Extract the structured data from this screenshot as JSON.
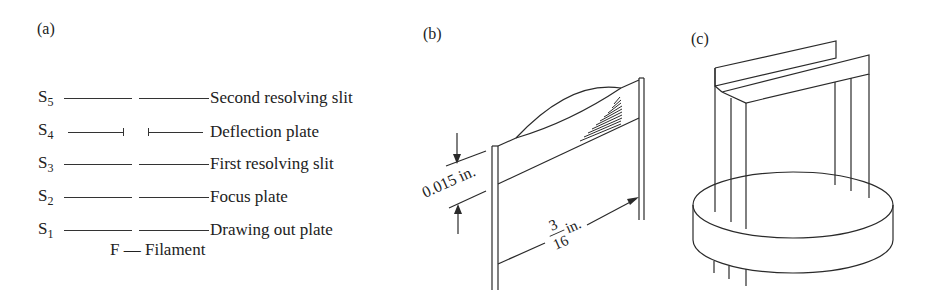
{
  "panels": {
    "a": {
      "label": "(a)",
      "rows": [
        {
          "symbol": "S",
          "sub": "5",
          "text": "Second resolving slit",
          "type": "slit"
        },
        {
          "symbol": "S",
          "sub": "4",
          "text": "Deflection plate",
          "type": "deflection"
        },
        {
          "symbol": "S",
          "sub": "3",
          "text": "First resolving slit",
          "type": "slit"
        },
        {
          "symbol": "S",
          "sub": "2",
          "text": "Focus plate",
          "type": "slit"
        },
        {
          "symbol": "S",
          "sub": "1",
          "text": "Drawing out plate",
          "type": "slit"
        }
      ],
      "filament": "F — Filament"
    },
    "b": {
      "label": "(b)",
      "dim_gap": "0.015 in.",
      "dim_width_num": "3",
      "dim_width_den": "16",
      "dim_width_unit": "in."
    },
    "c": {
      "label": "(c)"
    }
  },
  "colors": {
    "stroke": "#2a2a2a",
    "text": "#222222",
    "background": "#ffffff"
  }
}
